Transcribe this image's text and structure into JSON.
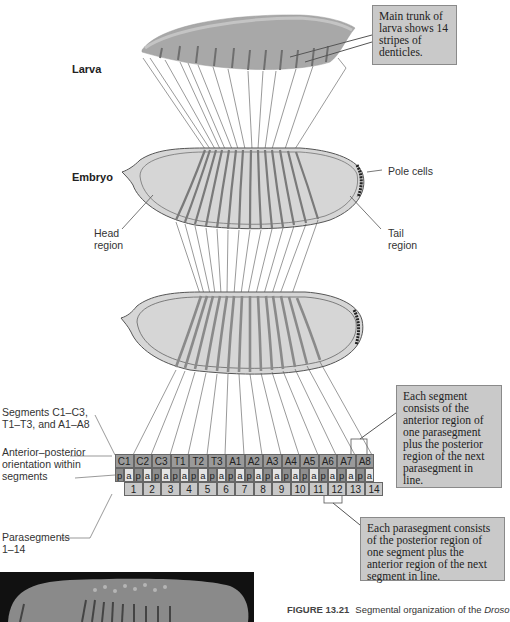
{
  "labels": {
    "larva": "Larva",
    "embryo": "Embryo",
    "head_region": [
      "Head",
      "region"
    ],
    "tail_region": [
      "Tail",
      "region"
    ],
    "pole_cells": "Pole cells",
    "segments_label": [
      "Segments C1–C3,",
      "T1–T3, and A1–A8"
    ],
    "orientation_label": [
      "Anterior–posterior",
      "orientation within",
      "segments"
    ],
    "parasegments_label": [
      "Parasegments",
      "1–14"
    ]
  },
  "callouts": {
    "larva_trunk": "Main trunk of larva shows 14 stripes of denticles.",
    "segment_def": "Each segment consists of the anterior region of one parasegment plus the posterior region of the next parasegment in line.",
    "parasegment_def": "Each parasegment consists of the posterior region of one segment plus the anterior region of the next segment in line."
  },
  "segments": [
    "C1",
    "C2",
    "C3",
    "T1",
    "T2",
    "T3",
    "A1",
    "A2",
    "A3",
    "A4",
    "A5",
    "A6",
    "A7",
    "A8"
  ],
  "orientation": [
    "p",
    "a",
    "p",
    "a",
    "p",
    "a",
    "p",
    "a",
    "p",
    "a",
    "p",
    "a",
    "p",
    "a",
    "p",
    "a",
    "p",
    "a",
    "p",
    "a",
    "p",
    "a",
    "p",
    "a",
    "p",
    "a",
    "p",
    "a"
  ],
  "parasegments": [
    "1",
    "2",
    "3",
    "4",
    "5",
    "6",
    "7",
    "8",
    "9",
    "10",
    "11",
    "12",
    "13",
    "14"
  ],
  "caption": {
    "figure_number": "FIGURE 13.21",
    "text_prefix": "Segmental organization of the ",
    "text_italic": "Droso"
  },
  "colors": {
    "callout_bg": "#c9c9c9",
    "embryo_fill": "#d6d6d6",
    "embryo_stroke": "#555555",
    "stripe": "#888888"
  }
}
